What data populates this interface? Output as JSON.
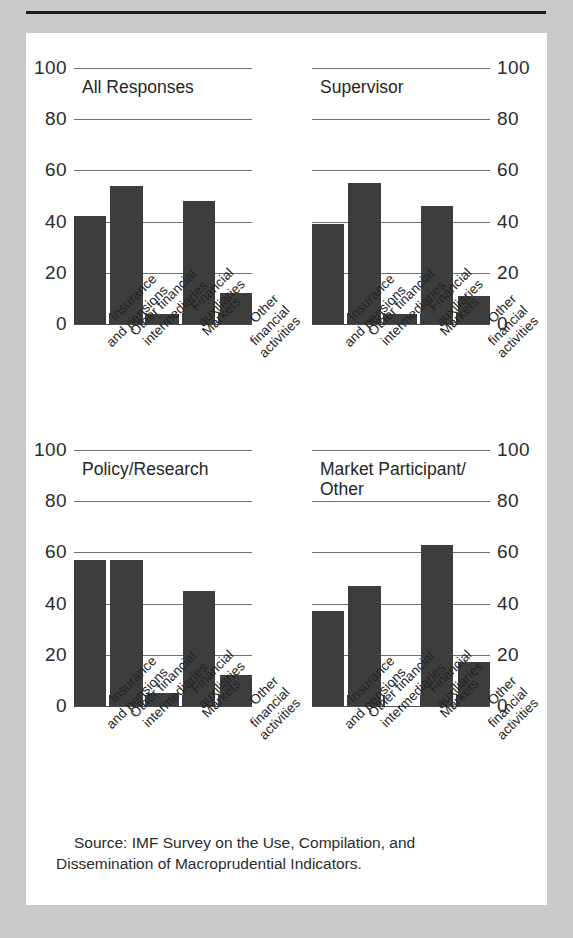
{
  "figure": {
    "source_note": "Source: IMF Survey on the Use, Compilation, and Dissemination of Macroprudential Indicators.",
    "bar_color": "#3d3d3d",
    "background_color": "#c9c9c9",
    "panel_color": "#ffffff"
  },
  "chart_data": {
    "type": "bar",
    "title": "",
    "xlabel": "",
    "ylabel": "",
    "ylim": [
      0,
      100
    ],
    "yticks": [
      0,
      20,
      40,
      60,
      80,
      100
    ],
    "grid": true,
    "legend": "none",
    "categories": [
      "Insurance\nand pensions",
      "Other financial\nintermediaries",
      "Financial auxiliaries",
      "Markets",
      "Other financial\nactivities"
    ],
    "panels": [
      {
        "title": "All Responses",
        "axis_side": "left",
        "values": [
          42,
          54,
          4,
          48,
          12
        ]
      },
      {
        "title": "Supervisor",
        "axis_side": "right",
        "values": [
          39,
          55,
          4,
          46,
          11
        ]
      },
      {
        "title": "Policy/Research",
        "axis_side": "left",
        "values": [
          57,
          57,
          5,
          45,
          12
        ]
      },
      {
        "title": "Market Participant/\nOther",
        "axis_side": "right",
        "values": [
          37,
          47,
          0,
          63,
          17
        ]
      }
    ]
  }
}
